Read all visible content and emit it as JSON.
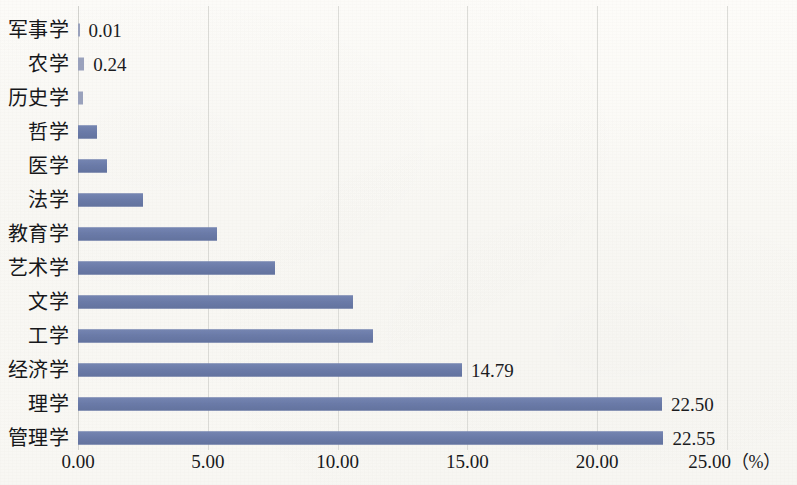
{
  "chart_data": {
    "type": "bar",
    "orientation": "horizontal",
    "title": "",
    "subtitle": "",
    "xlabel": "（%）",
    "ylabel": "",
    "xlim": [
      0,
      25
    ],
    "xticks": [
      "0.00",
      "5.00",
      "10.00",
      "15.00",
      "20.00",
      "25.00"
    ],
    "xtick_values": [
      0,
      5,
      10,
      15,
      20,
      25
    ],
    "unit_suffix": "（%）",
    "grid": "vertical",
    "legend": "none",
    "bar_color": "#6c7cab",
    "gridline_color": "#dcdcd8",
    "background_color": "#faf9f5",
    "categories": [
      "军事学",
      "农学",
      "历史学",
      "哲学",
      "医学",
      "法学",
      "教育学",
      "艺术学",
      "文学",
      "工学",
      "经济学",
      "理学",
      "管理学"
    ],
    "values": [
      0.01,
      0.24,
      0.2,
      0.75,
      1.1,
      2.5,
      5.35,
      7.6,
      10.6,
      11.35,
      14.79,
      22.5,
      22.55
    ],
    "data_labels": [
      "0.01",
      "0.24",
      "",
      "",
      "",
      "",
      "",
      "",
      "",
      "",
      "14.79",
      "22.50",
      "22.55"
    ],
    "bars": [
      {
        "category": "军事学",
        "value": 0.01,
        "label": "0.01"
      },
      {
        "category": "农学",
        "value": 0.24,
        "label": "0.24"
      },
      {
        "category": "历史学",
        "value": 0.2,
        "label": ""
      },
      {
        "category": "哲学",
        "value": 0.75,
        "label": ""
      },
      {
        "category": "医学",
        "value": 1.1,
        "label": ""
      },
      {
        "category": "法学",
        "value": 2.5,
        "label": ""
      },
      {
        "category": "教育学",
        "value": 5.35,
        "label": ""
      },
      {
        "category": "艺术学",
        "value": 7.6,
        "label": ""
      },
      {
        "category": "文学",
        "value": 10.6,
        "label": ""
      },
      {
        "category": "工学",
        "value": 11.35,
        "label": ""
      },
      {
        "category": "经济学",
        "value": 14.79,
        "label": "14.79"
      },
      {
        "category": "理学",
        "value": 22.5,
        "label": "22.50"
      },
      {
        "category": "管理学",
        "value": 22.55,
        "label": "22.55"
      }
    ]
  }
}
